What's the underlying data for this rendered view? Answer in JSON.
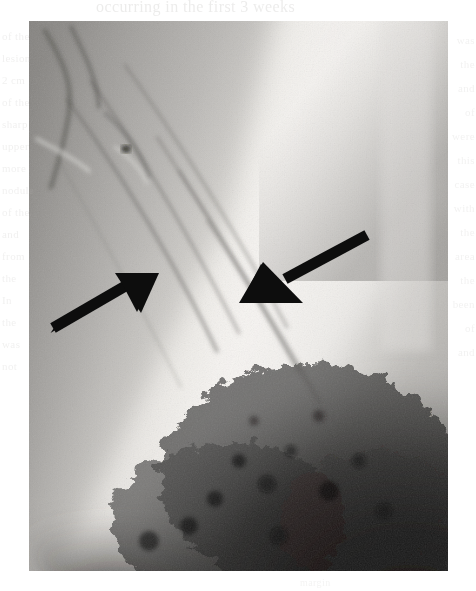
{
  "page": {
    "width": 476,
    "height": 591,
    "background_color": "#ffffff"
  },
  "ghost_text": {
    "top_line": "occurring in the first 3 weeks",
    "left_lines": [
      "of the",
      "lesion",
      "2 cm",
      "of the",
      "sharp",
      "upper",
      "more",
      "nodule",
      "of the",
      "and",
      "from",
      "the",
      "In",
      "the",
      "was",
      "not"
    ],
    "right_lines": [
      "was",
      "the",
      "and",
      "of",
      "were",
      "this",
      "case",
      "with",
      "the",
      "area",
      "the",
      "been",
      "of",
      "and"
    ],
    "bottom_line": "margin"
  },
  "figure": {
    "type": "radiograph",
    "modality": "plain-film-x-ray",
    "bounds": {
      "x": 29,
      "y": 21,
      "width": 419,
      "height": 550
    },
    "film_tone": {
      "bright_band": "#e8e6e2",
      "mid_tone": "#9a9896",
      "dark_region": "#22201f",
      "darkest": "#121111"
    },
    "regions": [
      {
        "name": "bright-diagonal-band",
        "description": "Broad bright (radiolucent) band running from upper-right down toward lower-left"
      },
      {
        "name": "mid-gray-soft-tissue",
        "description": "Mid-gray soft tissue occupying the left and central portion of the film"
      },
      {
        "name": "dark-mottled-opacity",
        "description": "Dark mottled region filling the lower-right quadrant of the film"
      },
      {
        "name": "linear-striations",
        "description": "Fine dark diagonal striations in the upper-left to mid-center area"
      }
    ]
  },
  "annotations": {
    "arrow_color": "#0d0d0d",
    "arrows": [
      {
        "id": "arrow-left",
        "label": "left-annotation-arrow",
        "direction": "points up-and-right",
        "tail": {
          "x": 52,
          "y": 337
        },
        "tip": {
          "x": 152,
          "y": 288
        },
        "head_span": {
          "x1": 117,
          "y1": 274,
          "x2": 157,
          "y2": 312
        },
        "shaft_width": 11
      },
      {
        "id": "arrow-right",
        "label": "right-annotation-arrow",
        "direction": "points down-and-left",
        "tail": {
          "x": 369,
          "y": 234
        },
        "tip": {
          "x": 264,
          "y": 292
        },
        "head_span": {
          "x1": 261,
          "y1": 263,
          "x2": 300,
          "y2": 301
        },
        "shaft_width": 11
      }
    ]
  }
}
